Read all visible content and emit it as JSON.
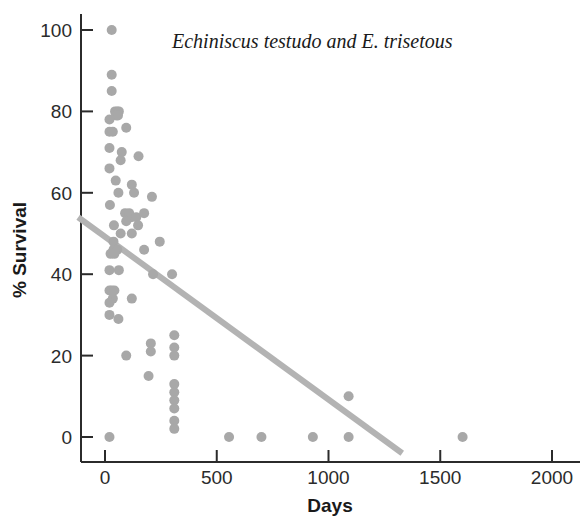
{
  "chart_data": {
    "type": "scatter",
    "title": "Echiniscus testudo and E. trisetous",
    "xlabel": "Days",
    "ylabel": "% Survival",
    "xlim": [
      -120,
      2080
    ],
    "ylim": [
      -8,
      104
    ],
    "xticks": [
      0,
      500,
      1000,
      1500,
      2000
    ],
    "xtick_labels": [
      "0",
      "500",
      "1000",
      "1500",
      "2000"
    ],
    "yticks": [
      0,
      20,
      40,
      60,
      80,
      100
    ],
    "ytick_labels": [
      "0",
      "20",
      "40",
      "60",
      "80",
      "100"
    ],
    "grid": false,
    "legend": "none",
    "marker_color": "#a8a8a8",
    "marker_size": 10,
    "axis_color": "#2b2b2b",
    "trendline": {
      "color": "#b3b3b3",
      "width": 6,
      "x0": -120,
      "y0": 54,
      "x1": 1330,
      "y1": -4,
      "slope": -0.04,
      "intercept": 49.2
    },
    "points": [
      [
        30,
        100
      ],
      [
        30,
        89
      ],
      [
        30,
        85
      ],
      [
        45,
        80
      ],
      [
        55,
        80
      ],
      [
        62,
        80
      ],
      [
        50,
        79
      ],
      [
        58,
        79
      ],
      [
        20,
        78
      ],
      [
        20,
        75
      ],
      [
        35,
        75
      ],
      [
        95,
        76
      ],
      [
        20,
        71
      ],
      [
        75,
        70
      ],
      [
        20,
        66
      ],
      [
        70,
        68
      ],
      [
        48,
        63
      ],
      [
        150,
        69
      ],
      [
        120,
        62
      ],
      [
        60,
        60
      ],
      [
        130,
        60
      ],
      [
        210,
        59
      ],
      [
        22,
        57
      ],
      [
        90,
        55
      ],
      [
        108,
        55
      ],
      [
        118,
        54
      ],
      [
        140,
        54
      ],
      [
        175,
        55
      ],
      [
        95,
        53
      ],
      [
        148,
        52
      ],
      [
        40,
        52
      ],
      [
        70,
        50
      ],
      [
        120,
        50
      ],
      [
        38,
        48
      ],
      [
        38,
        46
      ],
      [
        55,
        46
      ],
      [
        25,
        45
      ],
      [
        42,
        45
      ],
      [
        175,
        46
      ],
      [
        245,
        48
      ],
      [
        20,
        41
      ],
      [
        62,
        41
      ],
      [
        215,
        40
      ],
      [
        300,
        40
      ],
      [
        20,
        36
      ],
      [
        30,
        36
      ],
      [
        42,
        36
      ],
      [
        35,
        34
      ],
      [
        20,
        33
      ],
      [
        120,
        34
      ],
      [
        20,
        30
      ],
      [
        60,
        29
      ],
      [
        95,
        20
      ],
      [
        205,
        23
      ],
      [
        205,
        21
      ],
      [
        310,
        25
      ],
      [
        310,
        22
      ],
      [
        310,
        20
      ],
      [
        195,
        15
      ],
      [
        310,
        13
      ],
      [
        310,
        11
      ],
      [
        310,
        9
      ],
      [
        310,
        7
      ],
      [
        310,
        4
      ],
      [
        310,
        2
      ],
      [
        20,
        0
      ],
      [
        555,
        0
      ],
      [
        700,
        0
      ],
      [
        930,
        0
      ],
      [
        1090,
        0
      ],
      [
        1600,
        0
      ],
      [
        1090,
        10
      ]
    ]
  }
}
